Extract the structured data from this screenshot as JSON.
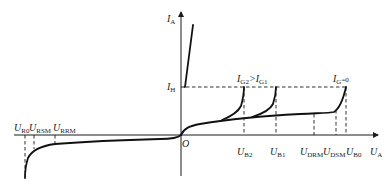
{
  "diagram": {
    "axes": {
      "y_label_main": "I",
      "y_label_sub": "A",
      "x_label_main": "U",
      "x_label_sub": "A",
      "origin": "O"
    },
    "current_levels": {
      "holding_main": "I",
      "holding_sub": "H"
    },
    "gate_annotations": {
      "left_main1": "I",
      "left_sub1": "G2",
      "relation": ">",
      "left_main2": "I",
      "left_sub2": "G1",
      "right_main": "I",
      "right_sub": "G",
      "right_eq": "=0"
    },
    "forward_voltages": [
      {
        "main": "U",
        "sub": "B2"
      },
      {
        "main": "U",
        "sub": "B1"
      },
      {
        "main": "U",
        "sub": "DRM"
      },
      {
        "main": "U",
        "sub": "DSM"
      },
      {
        "main": "U",
        "sub": "B0"
      }
    ],
    "reverse_voltages": [
      {
        "main": "U",
        "sub": "R0"
      },
      {
        "main": "U",
        "sub": "RSM"
      },
      {
        "main": "U",
        "sub": "RRM"
      }
    ],
    "colors": {
      "line": "#111111",
      "background": "#ffffff"
    }
  }
}
